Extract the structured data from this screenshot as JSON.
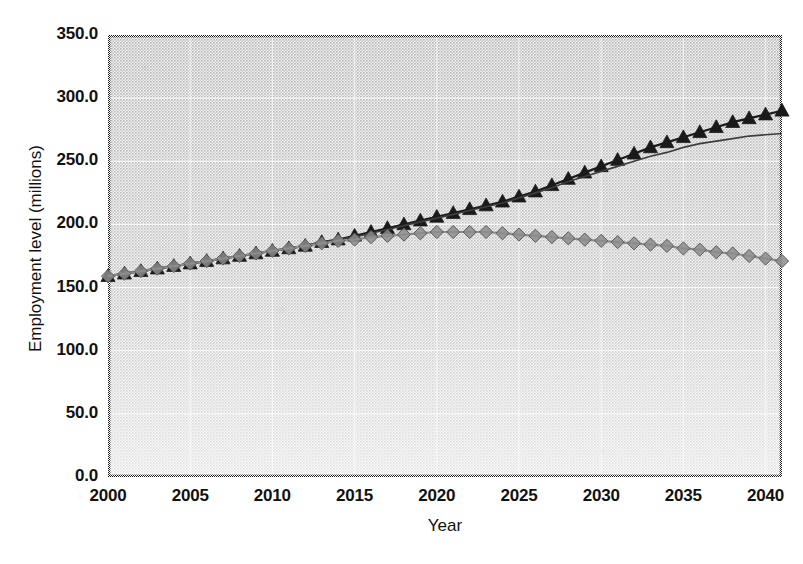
{
  "chart_data": {
    "type": "line",
    "title": "",
    "subtitle": "",
    "xlabel": "Year",
    "ylabel": "Employment level (millions)",
    "xlim": [
      2000,
      2041
    ],
    "ylim": [
      0.0,
      350.0
    ],
    "yticks": [
      "0.0",
      "50.0",
      "100.0",
      "150.0",
      "200.0",
      "250.0",
      "300.0",
      "350.0"
    ],
    "ytick_values": [
      0,
      50,
      100,
      150,
      200,
      250,
      300,
      350
    ],
    "xticks": [
      "2000",
      "2005",
      "2010",
      "2015",
      "2020",
      "2025",
      "2030",
      "2035",
      "2040"
    ],
    "xtick_values": [
      2000,
      2005,
      2010,
      2015,
      2020,
      2025,
      2030,
      2035,
      2040
    ],
    "grid": true,
    "legend": "none",
    "plot_background": "#d9d9d9",
    "x": [
      2000,
      2001,
      2002,
      2003,
      2004,
      2005,
      2006,
      2007,
      2008,
      2009,
      2010,
      2011,
      2012,
      2013,
      2014,
      2015,
      2016,
      2017,
      2018,
      2019,
      2020,
      2021,
      2022,
      2023,
      2024,
      2025,
      2026,
      2027,
      2028,
      2029,
      2030,
      2031,
      2032,
      2033,
      2034,
      2035,
      2036,
      2037,
      2038,
      2039,
      2040,
      2041
    ],
    "series": [
      {
        "name": "high-projection-triangles",
        "marker": "triangle",
        "color": "#1a1a1a",
        "values": [
          159,
          161,
          163,
          165,
          167,
          169,
          171,
          173,
          175,
          177,
          179,
          181,
          183,
          186,
          188,
          191,
          194,
          197,
          200,
          203,
          206,
          209,
          212,
          215,
          218,
          222,
          226,
          231,
          236,
          241,
          246,
          251,
          256,
          261,
          265,
          269,
          273,
          277,
          281,
          284,
          287,
          290
        ]
      },
      {
        "name": "mid-projection-line",
        "marker": "none",
        "color": "#3d3d3d",
        "values": [
          159,
          161,
          163,
          165,
          167,
          169,
          171,
          173,
          175,
          177,
          179,
          181,
          183,
          186,
          188,
          190,
          193,
          196,
          199,
          202,
          205,
          208,
          211,
          214,
          217,
          221,
          225,
          229,
          234,
          238,
          242,
          246,
          250,
          254,
          257,
          261,
          264,
          266,
          268,
          270,
          271,
          272
        ]
      },
      {
        "name": "low-projection-diamonds",
        "marker": "diamond",
        "color": "#8c8c8c",
        "values": [
          159,
          161,
          163,
          165,
          167,
          169,
          171,
          173,
          175,
          177,
          179,
          181,
          183,
          185,
          187,
          188,
          190,
          191,
          192,
          193,
          194,
          194,
          194,
          194,
          193,
          192,
          191,
          190,
          189,
          188,
          187,
          186,
          185,
          184,
          183,
          181,
          180,
          178,
          177,
          175,
          173,
          171
        ]
      }
    ]
  },
  "plot_geometry": {
    "left": 108,
    "right": 782,
    "top": 35,
    "bottom": 477
  }
}
